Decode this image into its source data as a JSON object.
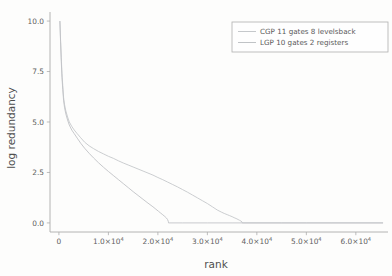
{
  "figure": {
    "background_color": "#fdfdfc",
    "axis_color": "#9a9a9a"
  },
  "chart_data": {
    "type": "line",
    "title": "",
    "subtitle": "",
    "xlabel": "rank",
    "ylabel": "log redundancy",
    "xlim": [
      -1800,
      66500
    ],
    "ylim": [
      -0.45,
      10.35
    ],
    "grid": false,
    "legend_position": "upper right",
    "xtick_values": [
      0,
      10000,
      20000,
      30000,
      40000,
      50000,
      60000
    ],
    "xtick_labels": [
      "0",
      "1.0×10",
      "2.0×10",
      "3.0×10",
      "4.0×10",
      "5.0×10",
      "6.0×10"
    ],
    "xtick_exponents": [
      "",
      "4",
      "4",
      "4",
      "4",
      "4",
      "4"
    ],
    "ytick_values": [
      0.0,
      2.5,
      5.0,
      7.5,
      10.0
    ],
    "ytick_labels": [
      "0.0",
      "2.5",
      "5.0",
      "7.5",
      "10.0"
    ],
    "series": [
      {
        "name": "CGP 11 gates 8 levelsback",
        "color": "#b9bcc0",
        "linewidth": 0.9,
        "x": [
          200,
          330,
          480,
          620,
          780,
          950,
          1150,
          1400,
          1750,
          2100,
          2600,
          3100,
          3700,
          4400,
          5200,
          6100,
          7000,
          8000,
          9000,
          10000,
          11000,
          12000,
          13000,
          14000,
          15000,
          16000,
          17000,
          18000,
          19000,
          20000,
          21000,
          22000,
          23000,
          24000,
          25000,
          26000,
          27000,
          28000,
          29000,
          30000,
          31000,
          32000,
          32800,
          33400,
          34000,
          34500,
          35000,
          35400,
          35800,
          36200,
          36500,
          36800,
          37000,
          37050,
          40000,
          45000,
          50000,
          55000,
          60000,
          65500
        ],
        "y": [
          10.0,
          9.1,
          8.2,
          7.4,
          6.8,
          6.2,
          5.85,
          5.55,
          5.25,
          5.0,
          4.78,
          4.6,
          4.42,
          4.22,
          4.0,
          3.82,
          3.68,
          3.54,
          3.42,
          3.3,
          3.2,
          3.08,
          2.97,
          2.87,
          2.77,
          2.67,
          2.57,
          2.47,
          2.37,
          2.25,
          2.14,
          2.02,
          1.9,
          1.78,
          1.65,
          1.52,
          1.38,
          1.24,
          1.1,
          0.96,
          0.8,
          0.64,
          0.54,
          0.47,
          0.41,
          0.36,
          0.31,
          0.26,
          0.22,
          0.17,
          0.13,
          0.09,
          0.05,
          0.0,
          0.0,
          0.0,
          0.0,
          0.0,
          0.0,
          0.0
        ]
      },
      {
        "name": "LGP 10 gates 2 registers",
        "color": "#b3b6ba",
        "linewidth": 0.9,
        "x": [
          200,
          330,
          480,
          620,
          780,
          950,
          1150,
          1400,
          1750,
          2100,
          2600,
          3100,
          3700,
          4400,
          5200,
          6100,
          7000,
          8000,
          9000,
          10000,
          11000,
          12000,
          13000,
          14000,
          15000,
          16000,
          17000,
          18000,
          19000,
          19600,
          20100,
          20600,
          21000,
          21400,
          21700,
          21950,
          22100,
          22150,
          25000,
          30000,
          35000,
          40000,
          45000,
          50000,
          55000,
          60000,
          65500
        ],
        "y": [
          10.0,
          9.0,
          8.0,
          7.2,
          6.6,
          6.05,
          5.7,
          5.4,
          5.1,
          4.85,
          4.6,
          4.42,
          4.2,
          3.95,
          3.7,
          3.45,
          3.22,
          2.98,
          2.76,
          2.55,
          2.35,
          2.15,
          1.95,
          1.75,
          1.55,
          1.36,
          1.17,
          0.98,
          0.8,
          0.68,
          0.58,
          0.48,
          0.4,
          0.32,
          0.25,
          0.17,
          0.08,
          0.0,
          0.0,
          0.0,
          0.0,
          0.0,
          0.0,
          0.0,
          0.0,
          0.0,
          0.0
        ]
      }
    ]
  },
  "legend": {
    "entries": [
      {
        "label": "CGP 11 gates 8 levelsback",
        "color": "#b9bcc0"
      },
      {
        "label": "LGP 10 gates 2 registers",
        "color": "#b3b6ba"
      }
    ]
  }
}
